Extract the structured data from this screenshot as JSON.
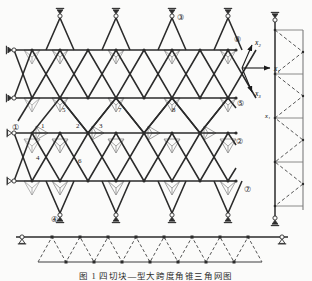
{
  "figure": {
    "caption": "图 1  四切块—型大跨度角锥三角网图",
    "type": "engineering-drawing"
  },
  "axes": {
    "origin_label": "",
    "items": [
      {
        "id": "x1",
        "label": "x₁",
        "direction": "right"
      },
      {
        "id": "x2",
        "label": "x₂",
        "direction": "upper-right"
      },
      {
        "id": "x3",
        "label": "x₃",
        "direction": "lower-right"
      }
    ]
  },
  "nodes": {
    "numbered": [
      {
        "id": "n1",
        "label": "1",
        "x": 44,
        "y": 130
      },
      {
        "id": "n2",
        "label": "2",
        "x": 78,
        "y": 130
      },
      {
        "id": "n3",
        "label": "3",
        "x": 100,
        "y": 130
      },
      {
        "id": "n4",
        "label": "4",
        "x": 40,
        "y": 170
      },
      {
        "id": "n5",
        "label": "5",
        "x": 62,
        "y": 112
      },
      {
        "id": "n6",
        "label": "6",
        "x": 78,
        "y": 170
      },
      {
        "id": "n7",
        "label": "7",
        "x": 118,
        "y": 112
      },
      {
        "id": "n8",
        "label": "8",
        "x": 172,
        "y": 112
      }
    ]
  },
  "markers": {
    "circled": [
      {
        "id": "m1",
        "label": "①",
        "x": 16,
        "y": 127
      },
      {
        "id": "m2",
        "label": "②",
        "x": 239,
        "y": 141
      },
      {
        "id": "m3",
        "label": "③",
        "x": 181,
        "y": 17
      },
      {
        "id": "m4",
        "label": "④",
        "x": 55,
        "y": 219
      },
      {
        "id": "m5",
        "label": "⑤",
        "x": 240,
        "y": 103
      },
      {
        "id": "m7",
        "label": "⑦",
        "x": 247,
        "y": 189
      },
      {
        "id": "m8",
        "label": "⑧",
        "x": 237,
        "y": 39
      }
    ]
  },
  "views": {
    "plan": {
      "name": "plan-view"
    },
    "right_elevation": {
      "name": "right-elevation",
      "axis_label": "x₁"
    },
    "bottom_elevation": {
      "name": "bottom-elevation"
    }
  },
  "colors": {
    "chord": "#2d2d2d",
    "web": "#7d7d7d",
    "dashed": "#555555",
    "background": "#fbfbfa",
    "text": "#1a1a1a"
  }
}
